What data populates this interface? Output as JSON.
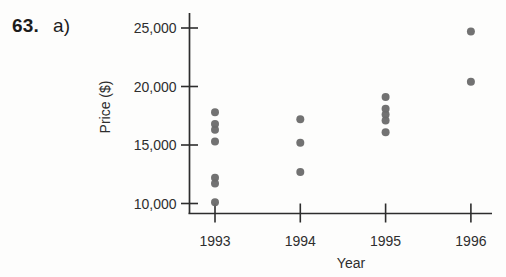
{
  "problem": {
    "number": "63.",
    "part": "a)"
  },
  "chart_data": {
    "type": "scatter",
    "title": "",
    "xlabel": "Year",
    "ylabel": "Price ($)",
    "x_ticks": [
      "1993",
      "1994",
      "1995",
      "1996"
    ],
    "x_tick_values": [
      1993,
      1994,
      1995,
      1996
    ],
    "y_tick_labels": [
      "25,000",
      "20,000",
      "15,000",
      "10,000"
    ],
    "y_tick_values": [
      25000,
      20000,
      15000,
      10000
    ],
    "xlim": [
      1992.7,
      1996.25
    ],
    "ylim": [
      9100,
      26300
    ],
    "grid": false,
    "points": [
      {
        "x": 1993,
        "y": 17800
      },
      {
        "x": 1993,
        "y": 16800
      },
      {
        "x": 1993,
        "y": 16300
      },
      {
        "x": 1993,
        "y": 15300
      },
      {
        "x": 1993,
        "y": 12200
      },
      {
        "x": 1993,
        "y": 11700
      },
      {
        "x": 1993,
        "y": 10100
      },
      {
        "x": 1994,
        "y": 17200
      },
      {
        "x": 1994,
        "y": 15200
      },
      {
        "x": 1994,
        "y": 12700
      },
      {
        "x": 1995,
        "y": 19100
      },
      {
        "x": 1995,
        "y": 18100
      },
      {
        "x": 1995,
        "y": 17600
      },
      {
        "x": 1995,
        "y": 17100
      },
      {
        "x": 1995,
        "y": 16100
      },
      {
        "x": 1996,
        "y": 24700
      },
      {
        "x": 1996,
        "y": 20400
      }
    ],
    "point_color": "#6a6a6a",
    "axis_color": "#2d2d2d",
    "label_color": "#2e2e2e"
  }
}
